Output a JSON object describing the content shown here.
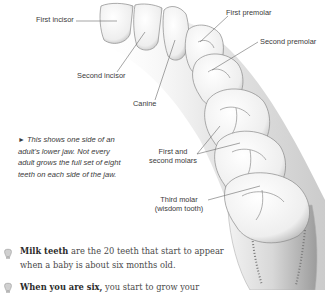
{
  "diagram": {
    "labels": {
      "first_incisor": "First incisor",
      "second_incisor": "Second incisor",
      "canine": "Canine",
      "first_premolar": "First premolar",
      "second_premolar": "Second premolar",
      "first_second_molars_line1": "First and",
      "first_second_molars_line2": "second molars",
      "third_molar_line1": "Third molar",
      "third_molar_line2": "(wisdom tooth)"
    },
    "caption": {
      "arrow": "►",
      "text": "This shows one side of an adult's lower jaw. Not every adult grows the full set of eight teeth on each side of the jaw."
    }
  },
  "body": {
    "paragraphs": [
      {
        "icon": "tooth-icon",
        "bold": "Milk teeth",
        "text": " are the 20 teeth that start to appear when a baby is about six months old."
      },
      {
        "icon": "tooth-icon",
        "bold": "When you are six,",
        "text": " you start to grow your"
      }
    ]
  },
  "colors": {
    "text": "#3a3a3a",
    "tooth_fill": "#f4f4f4",
    "tooth_shade": "#9a9a9a",
    "leader_line": "#6a6a6a"
  }
}
